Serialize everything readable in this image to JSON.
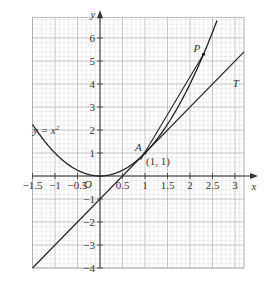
{
  "chart_data": {
    "type": "line",
    "title": "",
    "xlabel": "x",
    "ylabel": "y",
    "xlim": [
      -1.5,
      3.2
    ],
    "ylim": [
      -4,
      6.9
    ],
    "grid": true,
    "x_ticks": [
      "-1.5",
      "-1",
      "-0.5",
      "0.5",
      "1",
      "1.5",
      "2",
      "2.5",
      "3"
    ],
    "y_ticks": [
      "6",
      "5",
      "4",
      "3",
      "2",
      "1",
      "-1",
      "-2",
      "-3",
      "-4"
    ],
    "origin_label": "O",
    "series": [
      {
        "name": "y = x²",
        "type": "curve",
        "function": "x^2",
        "x_range": [
          -1.5,
          2.6
        ]
      },
      {
        "name": "T",
        "type": "line",
        "function": "2x - 1",
        "x_range": [
          -1.5,
          3.2
        ]
      },
      {
        "name": "AP",
        "type": "chord",
        "points": [
          [
            0.9,
            0.71
          ],
          [
            2.3,
            5.29
          ]
        ]
      }
    ],
    "points": [
      {
        "name": "A",
        "x": 1,
        "y": 1,
        "label": "(1, 1)"
      },
      {
        "name": "P",
        "x": 2.3,
        "y": 5.29
      }
    ],
    "annotations": {
      "curve_label": "y = x²",
      "tangent_label": "T",
      "point_A_label": "A",
      "point_A_coords": "(1, 1)",
      "point_P_label": "P"
    }
  }
}
